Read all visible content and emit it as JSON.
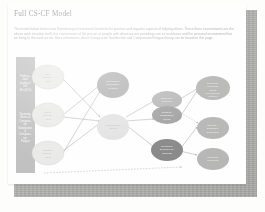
{
  "document": {
    "title": "Full CS-CF Model",
    "paragraph": "The model below shows how threatening environments lead into the positive and negative aspects of helping others. These three environments are the abuse work situation itself, the environment of the person or people with whom we are providing care or assistance and the personal environment that we bring to the work we do. More information about Compassion Satisfaction and Compassion Fatigue theory can be found on this page."
  },
  "colors": {
    "page_background": "#fefefe",
    "backdrop_shadow": "#b0b0ae",
    "panel_fill": "#b4b4b4",
    "env_node_fill": "#e6e6e4",
    "secondary_trauma_fill": "#9e9e9e",
    "compassion_stress_fill": "#dcdcda",
    "residual_fill": "#a8a8a8",
    "prolonged_fill": "#8a8a8a",
    "compassion_fatigue_fill": "#6c6c6c",
    "outcome_fill": "#a4a4a2",
    "arrow": "#9b9b9b",
    "title_text": "#6f6f70",
    "body_text": "#9a9a9a"
  },
  "diagram": {
    "panel": {
      "top_label": "Professional Quality of Life (ProQOL)",
      "bottom_label": "Traumatic Stress & Compassion Satisfaction & Compassion Fatigue"
    },
    "environment_nodes": [
      {
        "id": "work-environment",
        "label": "Work Environment"
      },
      {
        "id": "client-environment",
        "label": "Client Environment"
      },
      {
        "id": "personal-environment",
        "label": "Personal Environment"
      }
    ],
    "middle_nodes": [
      {
        "id": "compassion-satisfaction",
        "label": "Compassion Satisfaction (Positive)"
      },
      {
        "id": "compassion-stress",
        "label": "Compassion Stress"
      }
    ],
    "inner_nodes": [
      {
        "id": "secondary-exposure",
        "label": "Secondary Exposure"
      },
      {
        "id": "residual-compassion-stress",
        "label": "Residual Compassion Stress"
      },
      {
        "id": "prolonged-exposure",
        "label": "Prolonged Exposure To Suffering"
      }
    ],
    "outcome_nodes": [
      {
        "id": "secondary-traumatic-stress",
        "label": "Secondary Traumatic Stress (Compassion Fatigue)"
      },
      {
        "id": "burnout",
        "label": "Burnout / Emotional Exhaustion"
      },
      {
        "id": "traumatic-memories",
        "label": "Traumatic Memories"
      }
    ],
    "arrow_count": 14
  }
}
